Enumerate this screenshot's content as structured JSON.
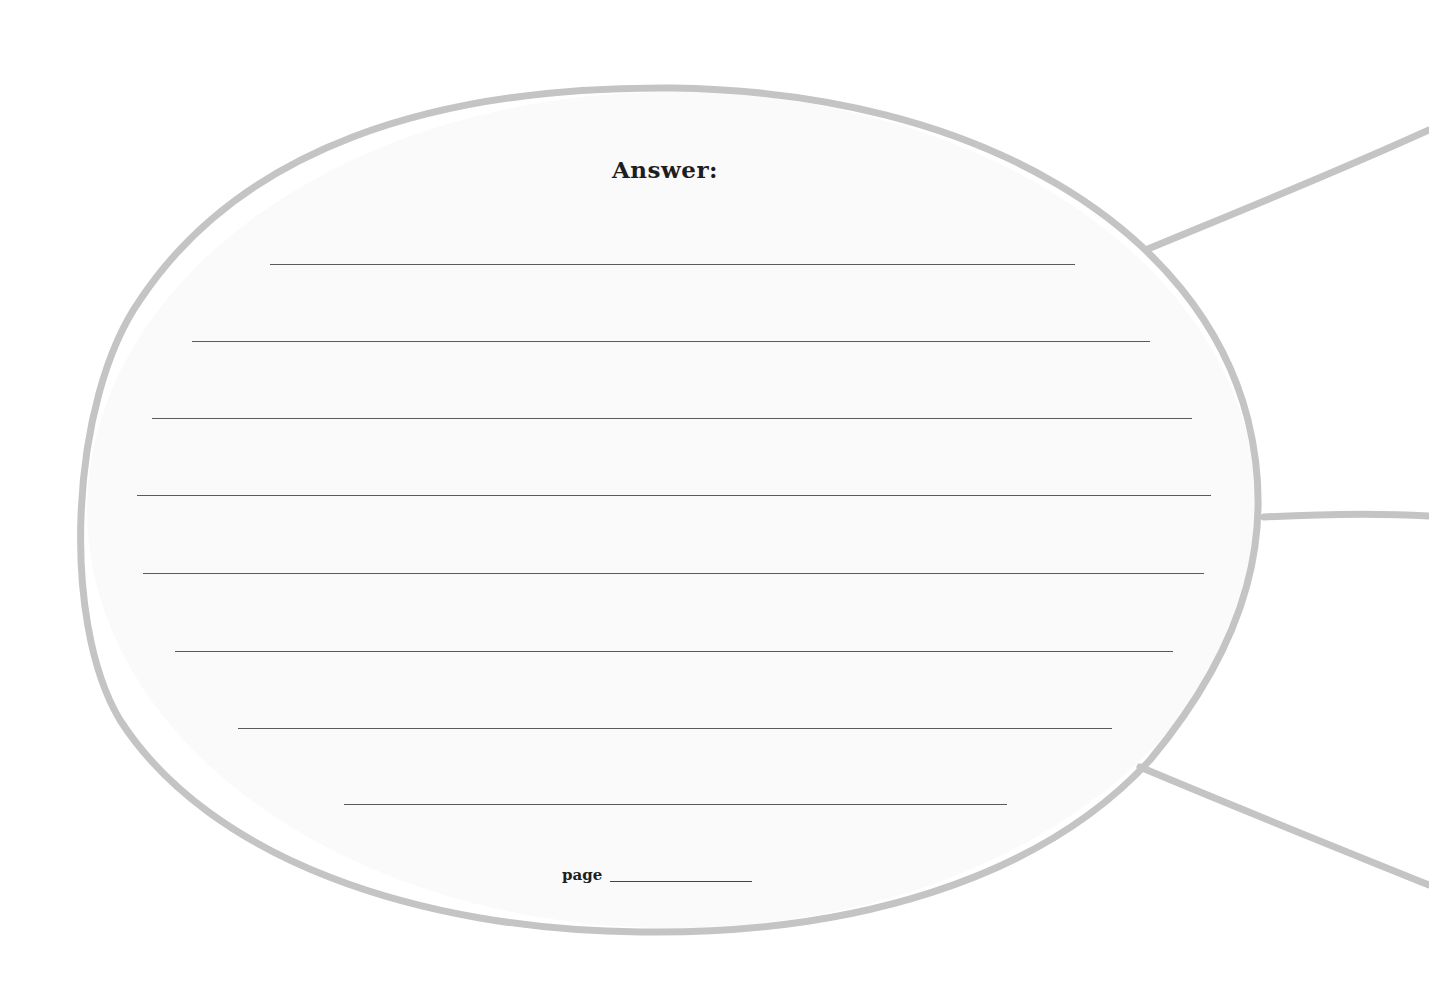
{
  "worksheet": {
    "title": "Answer:",
    "page_label": "page",
    "page_value": "",
    "colors": {
      "outline": "#c4c4c4",
      "rule_line": "#5a5a5a",
      "text": "#1e1e1e",
      "background": "#ffffff"
    },
    "answer_lines": [
      {
        "value": ""
      },
      {
        "value": ""
      },
      {
        "value": ""
      },
      {
        "value": ""
      },
      {
        "value": ""
      },
      {
        "value": ""
      },
      {
        "value": ""
      },
      {
        "value": ""
      }
    ],
    "connectors": [
      {
        "position": "upper-right"
      },
      {
        "position": "middle-right"
      },
      {
        "position": "lower-right"
      }
    ]
  }
}
